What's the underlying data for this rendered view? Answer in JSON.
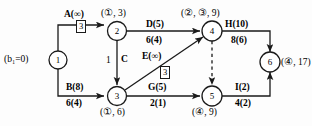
{
  "diagram": {
    "kind": "network-flow-diagram",
    "colors": {
      "line": "#1a1a1a",
      "text": "#000000",
      "background": "#fdfdfd"
    },
    "source_label": "(b₁=0)",
    "nodes": [
      {
        "id": "1",
        "number": "1",
        "label": "",
        "cx": 58,
        "cy": 60
      },
      {
        "id": "2",
        "number": "2",
        "label": "(①, 3)",
        "cx": 117,
        "cy": 31
      },
      {
        "id": "3",
        "number": "3",
        "label": "(①, 6)",
        "cx": 117,
        "cy": 96
      },
      {
        "id": "4",
        "number": "4",
        "label": "(②, ③, 9)",
        "cx": 212,
        "cy": 31
      },
      {
        "id": "5",
        "number": "5",
        "label": "(④, 9)",
        "cx": 212,
        "cy": 96
      },
      {
        "id": "6",
        "number": "6",
        "label": "(④, 17)",
        "cx": 270,
        "cy": 62
      }
    ],
    "edges": [
      {
        "id": "A",
        "name": "A(∞)",
        "capacity": "",
        "from": "1",
        "to": "2",
        "flow_box": "3",
        "style": "solid"
      },
      {
        "id": "B",
        "name": "B(8)",
        "capacity": "6(4)",
        "from": "1",
        "to": "3",
        "flow_box": "",
        "style": "solid"
      },
      {
        "id": "C",
        "name": "C",
        "capacity": "1",
        "from": "2",
        "to": "3",
        "flow_box": "",
        "style": "solid"
      },
      {
        "id": "D",
        "name": "D(5)",
        "capacity": "6(4)",
        "from": "2",
        "to": "4",
        "flow_box": "",
        "style": "solid"
      },
      {
        "id": "E",
        "name": "E(∞)",
        "capacity": "",
        "from": "3",
        "to": "4",
        "flow_box": "3",
        "style": "solid"
      },
      {
        "id": "G",
        "name": "G(5)",
        "capacity": "2(1)",
        "from": "3",
        "to": "5",
        "flow_box": "",
        "style": "solid"
      },
      {
        "id": "H",
        "name": "H(10)",
        "capacity": "8(6)",
        "from": "4",
        "to": "6",
        "flow_box": "",
        "style": "solid"
      },
      {
        "id": "F",
        "name": "",
        "capacity": "",
        "from": "4",
        "to": "5",
        "flow_box": "",
        "style": "dashed"
      },
      {
        "id": "I",
        "name": "I(2)",
        "capacity": "4(2)",
        "from": "5",
        "to": "6",
        "flow_box": "",
        "style": "solid"
      }
    ],
    "text_items": {
      "source": "(b₁=0)",
      "node1_num": "1",
      "node2_num": "2",
      "node3_num": "3",
      "node4_num": "4",
      "node5_num": "5",
      "node6_num": "6",
      "node2_label": "(①, 3)",
      "node3_label": "(①, 6)",
      "node4_label": "(②, ③, 9)",
      "node5_label": "(④, 9)",
      "node6_label": "(④, 17)",
      "edgeA_name": "A(∞)",
      "edgeA_box": "3",
      "edgeB_name": "B(8)",
      "edgeB_cap": "6(4)",
      "edgeC_name": "C",
      "edgeC_cap": "1",
      "edgeD_name": "D(5)",
      "edgeD_cap": "6(4)",
      "edgeE_name": "E(∞)",
      "edgeE_box": "3",
      "edgeG_name": "G(5)",
      "edgeG_cap": "2(1)",
      "edgeH_name": "H(10)",
      "edgeH_cap": "8(6)",
      "edgeI_name": "I(2)",
      "edgeI_cap": "4(2)"
    }
  }
}
